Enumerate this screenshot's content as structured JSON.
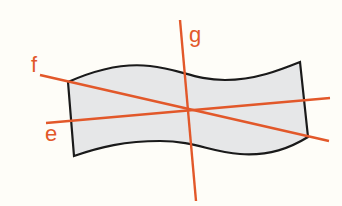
{
  "diagram": {
    "type": "geometric-figure",
    "colors": {
      "background": "#fefdf8",
      "shape_fill": "#e6e7e8",
      "shape_stroke": "#1a1a1a",
      "line_color": "#e2582a",
      "label_color": "#e2582a"
    },
    "shape": {
      "name": "wavy-strip",
      "corners": {
        "top_left": [
          68,
          82
        ],
        "top_right": [
          300,
          62
        ],
        "bottom_right": [
          308,
          137
        ],
        "bottom_left": [
          74,
          156
        ]
      }
    },
    "lines": [
      {
        "id": "f",
        "label": "f",
        "from": [
          40,
          75
        ],
        "to": [
          329,
          141
        ]
      },
      {
        "id": "e",
        "label": "e",
        "from": [
          46,
          123
        ],
        "to": [
          330,
          98
        ]
      },
      {
        "id": "g",
        "label": "g",
        "from": [
          180,
          20
        ],
        "to": [
          196,
          201
        ]
      }
    ],
    "intersection_point": [
      187,
      107
    ],
    "labels": {
      "f": "f",
      "e": "e",
      "g": "g"
    }
  }
}
